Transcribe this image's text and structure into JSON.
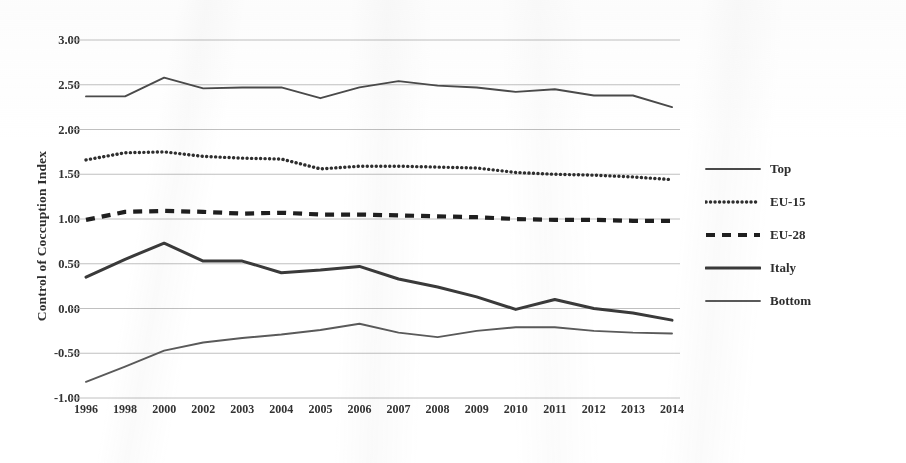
{
  "chart_data": {
    "type": "line",
    "title": "",
    "xlabel": "",
    "ylabel": "Control of Coccuption Index",
    "ylim": [
      -1.0,
      3.0
    ],
    "ytick_step": 0.5,
    "grid": true,
    "legend_position": "right",
    "categories": [
      "1996",
      "1998",
      "2000",
      "2002",
      "2003",
      "2004",
      "2005",
      "2006",
      "2007",
      "2008",
      "2009",
      "2010",
      "2011",
      "2012",
      "2013",
      "2014"
    ],
    "yticks": [
      "3.00",
      "2.50",
      "2.00",
      "1.50",
      "1.00",
      "0.50",
      "0.00",
      "-0.50",
      "-1.00"
    ],
    "series": [
      {
        "name": "Top",
        "style": "solid-thin",
        "color": "#4a4a4a",
        "values": [
          2.37,
          2.37,
          2.58,
          2.46,
          2.47,
          2.47,
          2.35,
          2.47,
          2.54,
          2.49,
          2.47,
          2.42,
          2.45,
          2.38,
          2.38,
          2.25
        ]
      },
      {
        "name": "EU-15",
        "style": "dotted",
        "color": "#2e2e2e",
        "values": [
          1.66,
          1.74,
          1.75,
          1.7,
          1.68,
          1.67,
          1.56,
          1.59,
          1.59,
          1.58,
          1.57,
          1.52,
          1.5,
          1.49,
          1.47,
          1.44
        ]
      },
      {
        "name": "EU-28",
        "style": "dashed",
        "color": "#1f1f1f",
        "values": [
          0.99,
          1.08,
          1.09,
          1.08,
          1.06,
          1.07,
          1.05,
          1.05,
          1.04,
          1.03,
          1.02,
          1.0,
          0.99,
          0.99,
          0.98,
          0.98
        ]
      },
      {
        "name": "Italy",
        "style": "solid-thick",
        "color": "#3a3a3a",
        "values": [
          0.35,
          0.55,
          0.73,
          0.53,
          0.53,
          0.4,
          0.43,
          0.47,
          0.33,
          0.24,
          0.13,
          -0.01,
          0.1,
          0.0,
          -0.05,
          -0.13
        ]
      },
      {
        "name": "Bottom",
        "style": "solid-thin",
        "color": "#5a5a5a",
        "values": [
          -0.82,
          -0.65,
          -0.47,
          -0.38,
          -0.33,
          -0.29,
          -0.24,
          -0.17,
          -0.27,
          -0.32,
          -0.25,
          -0.21,
          -0.21,
          -0.25,
          -0.27,
          -0.28
        ]
      }
    ]
  },
  "legend": {
    "items": [
      {
        "label": "Top"
      },
      {
        "label": "EU-15"
      },
      {
        "label": "EU-28"
      },
      {
        "label": "Italy"
      },
      {
        "label": "Bottom"
      }
    ]
  }
}
